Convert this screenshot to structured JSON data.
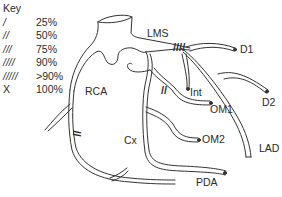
{
  "key": {
    "title": "Key",
    "rows": [
      {
        "symbol": "/",
        "value": "25%"
      },
      {
        "symbol": "//",
        "value": "50%"
      },
      {
        "symbol": "///",
        "value": "75%"
      },
      {
        "symbol": "////",
        "value": "90%"
      },
      {
        "symbol": "/////",
        "value": ">90%"
      },
      {
        "symbol": "X",
        "value": "100%"
      }
    ]
  },
  "labels": {
    "lms": "LMS",
    "d1": "D1",
    "d2": "D2",
    "lad": "LAD",
    "int": "Int",
    "om1": "OM1",
    "om2": "OM2",
    "cx": "Cx",
    "pda": "PDA",
    "rca": "RCA"
  },
  "lesions": [
    {
      "vessel": "LMS",
      "marks": "////",
      "severity": "90%"
    },
    {
      "vessel": "OM1",
      "marks": "//",
      "severity": "50%"
    },
    {
      "vessel": "RCA",
      "marks": "//",
      "severity": "50%"
    }
  ]
}
